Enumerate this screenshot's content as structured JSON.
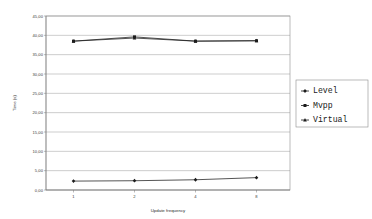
{
  "chart_data": {
    "type": "line",
    "title": "",
    "xlabel": "Update frequency",
    "ylabel": "Time (s)",
    "x": [
      1,
      2,
      4,
      8
    ],
    "categories": [
      "1",
      "2",
      "4",
      "8"
    ],
    "xtick_labels": [
      "1",
      "2",
      "4",
      "8"
    ],
    "ytick_labels": [
      "45,00",
      "40,00",
      "35,00",
      "30,00",
      "25,00",
      "20,00",
      "15,00",
      "10,00",
      "5,00",
      "0,00"
    ],
    "ytick_values": [
      45,
      40,
      35,
      30,
      25,
      20,
      15,
      10,
      5,
      0
    ],
    "ylim": [
      0,
      45
    ],
    "grid": true,
    "grid_axis": "y",
    "legend_position": "right",
    "series": [
      {
        "name": "Level",
        "marker": "diamond",
        "color": "#1c1c1c",
        "values": [
          2.3,
          2.4,
          2.65,
          3.2
        ]
      },
      {
        "name": "Mvpp",
        "marker": "square",
        "color": "#1c1c1c",
        "values": [
          38.5,
          39.6,
          38.5,
          38.6
        ]
      },
      {
        "name": "Virtual",
        "marker": "triangle",
        "color": "#1c1c1c",
        "values": [
          38.5,
          39.3,
          38.5,
          38.6
        ]
      }
    ]
  },
  "legend": {
    "entries": [
      {
        "label": "Level"
      },
      {
        "label": "Mvpp"
      },
      {
        "label": "Virtual"
      }
    ]
  },
  "axes": {
    "y_title": "Time (s)",
    "x_title": "Update frequency"
  }
}
